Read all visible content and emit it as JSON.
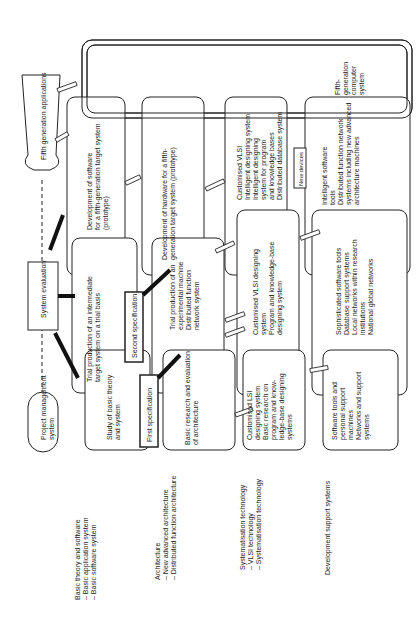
{
  "rows": {
    "basic": {
      "title": "Basic theory and software",
      "items": [
        "–  Basic application system",
        "–  Basic software system"
      ]
    },
    "architecture": {
      "title": "Architecture",
      "items": [
        "–  New advanced architecture",
        "–  Distributed function architecture"
      ]
    },
    "systemisation": {
      "title": "Systematisation technology",
      "items": [
        "–  VLSI technology",
        "–  Systematisation technology"
      ]
    },
    "support": {
      "title": "Development support systems"
    }
  },
  "project_management": [
    "Project management",
    "system"
  ],
  "system_evaluation": "System evaluation",
  "fifth_generation_applications": "Fifth generation applications",
  "fifth_generation_system": [
    "Fifth-",
    "generation",
    "computer",
    "system"
  ],
  "first_specification": "First specification",
  "second_specification": "Second specification",
  "new_devices": "New devices",
  "stage1": {
    "basic": [
      "Study of basic theory",
      "and system"
    ],
    "architecture": [
      "Basic research and evaluation",
      "of architecture"
    ],
    "systemisation": [
      "Customised LSI",
      "designing system",
      "Basic research on",
      "program and know-",
      "ledge-base designing",
      "systems"
    ],
    "support": [
      "Software tools and",
      "personal support",
      "machines",
      "Networks and support",
      "systems"
    ]
  },
  "stage2": {
    "basic": [
      "Trial production of an intermediate",
      "target system on a trial basis"
    ],
    "architecture": [
      "Trial production of an",
      "experimental machine",
      "Distributed function",
      "network system"
    ],
    "systemisation": [
      "Customised VLSI designing",
      "system",
      "Program and knowledge-base",
      "designing system"
    ],
    "support": [
      "Sophisticated software tools",
      "Database support systems",
      "Local networks within research",
      "institutions",
      "National global networks"
    ]
  },
  "stage3": {
    "basic": [
      "Development of software",
      "for a fifth-generation target system",
      "(prototype)"
    ],
    "architecture": [
      "Development of hardware for a fifth-",
      "generation target system (prototype)"
    ],
    "systemisation": [
      "Customised VLSI",
      "Intelligent designing system",
      "Intelligent designing",
      "system for program",
      "and knowledge bases",
      "Distributed database system"
    ],
    "support": [
      "Intelligent software",
      "tools",
      "Distributed function network",
      "systems including new advanced",
      "architecture machines"
    ]
  }
}
